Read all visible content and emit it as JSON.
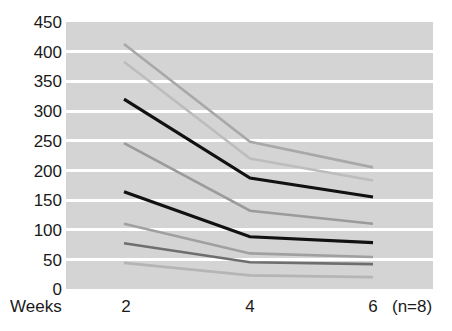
{
  "chart_data": {
    "type": "line",
    "title": "",
    "subtitle": "",
    "xlabel": "Weeks",
    "ylabel": "",
    "annotation": "(n=8)",
    "x": [
      2,
      4,
      6
    ],
    "categories": [
      "2",
      "4",
      "6"
    ],
    "xtick_labels": [
      "2",
      "4",
      "6"
    ],
    "ytick_labels": [
      "450",
      "400",
      "350",
      "300",
      "250",
      "200",
      "150",
      "100",
      "50",
      "0"
    ],
    "yticks": [
      450,
      400,
      350,
      300,
      250,
      200,
      150,
      100,
      50,
      0
    ],
    "ylim": [
      0,
      450
    ],
    "xlim": [
      2,
      6
    ],
    "grid": "horizontal",
    "legend": "none",
    "plot_background": "#d4d4d4",
    "gridline_color": "#ffffff",
    "series": [
      {
        "name": "subject-1",
        "values": [
          413,
          248,
          205
        ],
        "color": "#a8a8a8",
        "width": 2.6
      },
      {
        "name": "subject-2",
        "values": [
          383,
          220,
          183
        ],
        "color": "#bdbdbd",
        "width": 2.6
      },
      {
        "name": "subject-3",
        "values": [
          320,
          187,
          155
        ],
        "color": "#111111",
        "width": 3.2
      },
      {
        "name": "subject-4",
        "values": [
          246,
          132,
          110
        ],
        "color": "#9b9b9b",
        "width": 2.6
      },
      {
        "name": "subject-5",
        "values": [
          164,
          88,
          78
        ],
        "color": "#111111",
        "width": 3.2
      },
      {
        "name": "subject-6",
        "values": [
          110,
          60,
          54
        ],
        "color": "#a0a0a0",
        "width": 2.6
      },
      {
        "name": "subject-7",
        "values": [
          77,
          45,
          42
        ],
        "color": "#6e6e6e",
        "width": 2.6
      },
      {
        "name": "subject-8",
        "values": [
          44,
          23,
          20
        ],
        "color": "#b5b5b5",
        "width": 2.6
      }
    ]
  }
}
